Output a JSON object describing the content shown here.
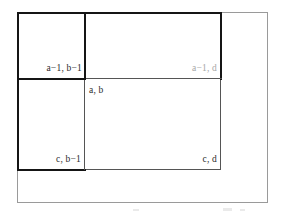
{
  "figure": {
    "type": "diagram",
    "labels": [
      {
        "id": "top-left-cell",
        "text": "a−1, b−1",
        "style": "dark"
      },
      {
        "id": "top-right-cell",
        "text": "a−1, d",
        "style": "faded"
      },
      {
        "id": "center-corner",
        "text": "a, b",
        "style": "dark"
      },
      {
        "id": "bottom-left-cell",
        "text": "c, b−1",
        "style": "dark"
      },
      {
        "id": "bottom-right-cell",
        "text": "c, d",
        "style": "dark"
      }
    ],
    "colors": {
      "stroke_thick": "#151515",
      "stroke_thin": "#555555",
      "frame": "#9a9a9a",
      "label_dark": "#2b2b2b",
      "label_faded": "#a6a6a6",
      "background": "#ffffff"
    },
    "geometry": {
      "outer_frame": {
        "x": 17,
        "y": 12,
        "w": 251,
        "h": 191
      },
      "big_box": {
        "x": 17,
        "y": 12,
        "w": 205,
        "h": 158
      },
      "inner_split_x": 85,
      "inner_split_y": 79
    }
  }
}
